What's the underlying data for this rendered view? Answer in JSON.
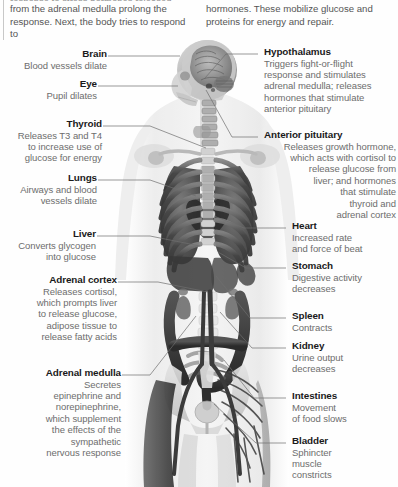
{
  "page": {
    "background": "#fefefe",
    "heading_color": "#1a1a1a",
    "body_text_color": "#6d6d6d",
    "leader_line_color": "#6f6f6f"
  },
  "intro": {
    "clipped_top_line": "response to stress hormones released",
    "left": "from the adrenal medulla prolong the\nresponse. Next, the body tries to respond to",
    "right": "hormones. These mobilize glucose and\nproteins for energy and repair."
  },
  "figure": {
    "alt": "grayscale anatomical illustration of a human body showing skull, brain, spine, ribcage, lungs, heart, abdominal organs, colon, pelvis and blood vessels",
    "regions": [
      "skull-and-brain",
      "cervical-spine",
      "ribcage",
      "lungs",
      "heart",
      "liver",
      "stomach",
      "spleen",
      "kidneys",
      "colon",
      "small-intestine",
      "pelvis",
      "bladder",
      "blood-vessels",
      "leg-muscles"
    ]
  },
  "callouts_left": [
    {
      "id": "brain",
      "title": "Brain",
      "body": "Blood vessels dilate"
    },
    {
      "id": "eye",
      "title": "Eye",
      "body": "Pupil dilates"
    },
    {
      "id": "thyroid",
      "title": "Thyroid",
      "body": "Releases T3 and T4\nto increase use of\nglucose for energy"
    },
    {
      "id": "lungs",
      "title": "Lungs",
      "body": "Airways and blood\nvessels dilate"
    },
    {
      "id": "liver",
      "title": "Liver",
      "body": "Converts glycogen\ninto glucose"
    },
    {
      "id": "adrenal-cortex",
      "title": "Adrenal cortex",
      "body": "Releases cortisol,\nwhich prompts liver\nto release glucose,\nadipose tissue to\nrelease fatty acids"
    },
    {
      "id": "adrenal-medulla",
      "title": "Adrenal medulla",
      "body": "Secretes\nepinephrine and\nnorepinephrine,\nwhich supplement\nthe effects of the\nsympathetic\nnervous response"
    }
  ],
  "callouts_right": [
    {
      "id": "hypothalamus",
      "title": "Hypothalamus",
      "body": "Triggers fight-or-flight\nresponse and stimulates\nadrenal medulla; releases\nhormones that stimulate\nanterior pituitary"
    },
    {
      "id": "anterior-pituitary",
      "title": "Anterior pituitary",
      "body": "Releases growth hormone,\nwhich acts with cortisol to\nrelease glucose from\nliver; and hormones\nthat stimulate\nthyroid and\nadrenal cortex"
    },
    {
      "id": "heart",
      "title": "Heart",
      "body": "Increased rate\nand force of beat"
    },
    {
      "id": "stomach",
      "title": "Stomach",
      "body": "Digestive activity\ndecreases"
    },
    {
      "id": "spleen",
      "title": "Spleen",
      "body": "Contracts"
    },
    {
      "id": "kidney",
      "title": "Kidney",
      "body": "Urine output\ndecreases"
    },
    {
      "id": "intestines",
      "title": "Intestines",
      "body": "Movement\nof food slows"
    },
    {
      "id": "bladder",
      "title": "Bladder",
      "body": "Sphincter\nmuscle\nconstricts"
    }
  ]
}
